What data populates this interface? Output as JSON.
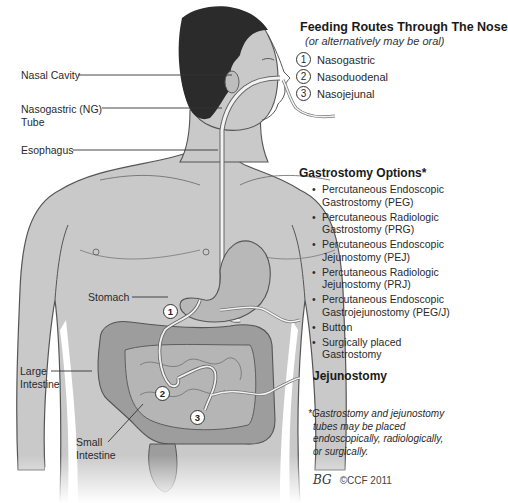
{
  "header": {
    "title": "Feeding Routes Through The Nose",
    "subtitle": "(or alternatively may be oral)"
  },
  "routes": [
    {
      "num": "1",
      "label": "Nasogastric"
    },
    {
      "num": "2",
      "label": "Nasoduodenal"
    },
    {
      "num": "3",
      "label": "Nasojejunal"
    }
  ],
  "anatomy_labels": {
    "nasal_cavity": "Nasal Cavity",
    "ng_tube_line1": "Nasogastric (NG)",
    "ng_tube_line2": "Tube",
    "esophagus": "Esophagus",
    "stomach": "Stomach",
    "large_intestine_line1": "Large",
    "large_intestine_line2": "Intestine",
    "small_intestine_line1": "Small",
    "small_intestine_line2": "Intestine"
  },
  "markers": [
    "1",
    "2",
    "3"
  ],
  "gastrostomy": {
    "title": "Gastrostomy Options*",
    "bullet": "•",
    "options": [
      {
        "line1": "Percutaneous Endoscopic",
        "line2": "Gastrostomy (PEG)"
      },
      {
        "line1": "Percutaneous Radiologic",
        "line2": "Gastrostomy (PRG)"
      },
      {
        "line1": "Percutaneous Endoscopic",
        "line2": "Jejunostomy (PEJ)"
      },
      {
        "line1": "Percutaneous Radiologic",
        "line2": "Jejunostomy (PRJ)"
      },
      {
        "line1": "Percutaneous Endoscopic",
        "line2": "Gastrojejunostomy (PEG/J)"
      },
      {
        "line1": "Button",
        "line2": ""
      },
      {
        "line1": "Surgically placed Gastrostomy",
        "line2": ""
      }
    ]
  },
  "jejunostomy": {
    "title": "Jejunostomy"
  },
  "footnote": {
    "line1": "*Gastrostomy and jejunostomy",
    "line2": "tubes may be placed",
    "line3": "endoscopically, radiologically,",
    "line4": "or surgically."
  },
  "credit": {
    "signature": "BG",
    "copyright": "©CCF 2011"
  },
  "colors": {
    "skin": "#c9c9c9",
    "skin_shade": "#b5b5b5",
    "hair": "#2b2b2b",
    "outline": "#555555",
    "organ": "#a8a8a8",
    "organ_dark": "#8e8e8e",
    "tube": "#f2f2f2"
  }
}
